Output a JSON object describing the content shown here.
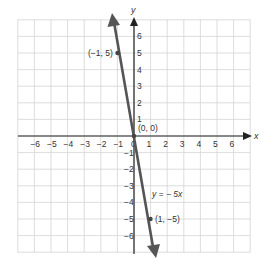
{
  "chart_data": {
    "type": "line",
    "title": "",
    "xlabel": "x",
    "ylabel": "y",
    "xlim": [
      -6.5,
      6.5
    ],
    "ylim": [
      -6.5,
      6.5
    ],
    "grid": true,
    "x_ticks": [
      "-6",
      "-5",
      "-4",
      "-3",
      "-2",
      "-1",
      "0",
      "1",
      "2",
      "3",
      "4",
      "5",
      "6"
    ],
    "y_ticks": [
      "6",
      "5",
      "4",
      "3",
      "2",
      "1",
      "-1",
      "-2",
      "-3",
      "-4",
      "-5",
      "-6"
    ],
    "series": [
      {
        "name": "y = -5x",
        "equation": "y = − 5x",
        "x": [
          -1,
          0,
          1
        ],
        "y": [
          5,
          0,
          -5
        ]
      }
    ],
    "points": [
      {
        "label": "(−1, 5)",
        "x": -1,
        "y": 5
      },
      {
        "label": "(0, 0)",
        "x": 0,
        "y": 0
      },
      {
        "label": "(1, −5)",
        "x": 1,
        "y": -5
      }
    ]
  },
  "labels": {
    "x_axis": "x",
    "y_axis": "y",
    "equation": "y = − 5x",
    "p1": "(−1, 5)",
    "p0": "(0, 0)",
    "p2": "(1, −5)",
    "xt": [
      "−6",
      "−5",
      "−4",
      "−3",
      "−2",
      "−1",
      "0",
      "1",
      "2",
      "3",
      "4",
      "5",
      "6"
    ],
    "yt": [
      "6",
      "5",
      "4",
      "3",
      "2",
      "1",
      "−1",
      "−2",
      "−3",
      "−4",
      "−5",
      "−6"
    ]
  }
}
